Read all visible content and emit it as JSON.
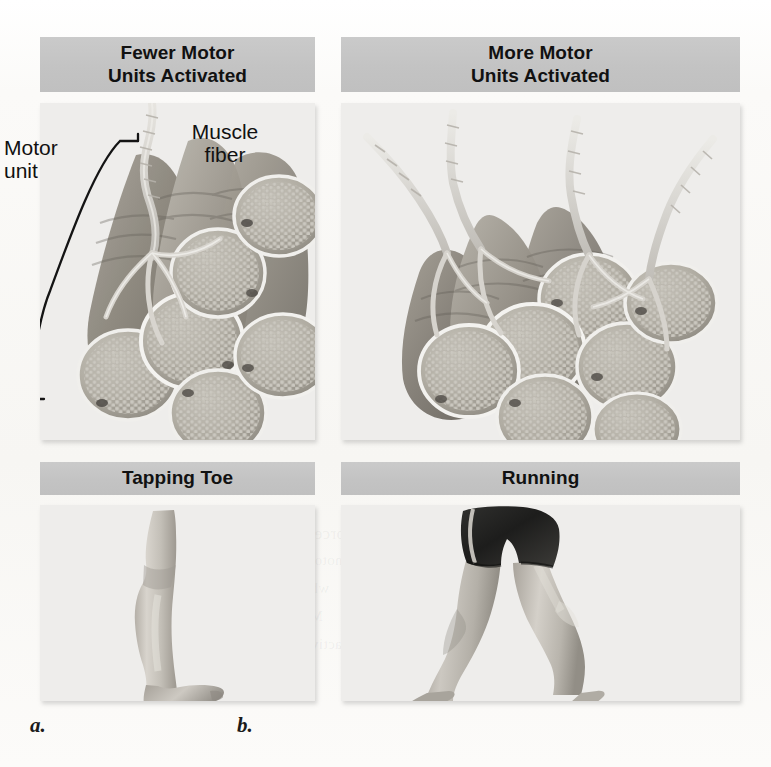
{
  "figure": {
    "background_color": "#fbfaf8",
    "bar_color": "#c5c5c5",
    "panel_color": "#eeedeb"
  },
  "panels": {
    "a": {
      "caption": "a.",
      "header": {
        "line1": "Fewer Motor",
        "line2": "Units Activated"
      },
      "sublabel": "Tapping Toe",
      "annotations": {
        "motor_unit": "Motor\nunit",
        "muscle_fiber": "Muscle\nfiber"
      },
      "illustration": "motor-unit-few-fibers",
      "photo": "tapping-toe-leg"
    },
    "b": {
      "caption": "b.",
      "header": {
        "line1": "More Motor",
        "line2": "Units Activated"
      },
      "sublabel": "Running",
      "annotations": {},
      "illustration": "motor-unit-many-fibers",
      "photo": "running-legs"
    }
  },
  "bleed_through_text": [
    "Figure 10.9 Recruitment",
    "of motor units varies with",
    "the force needed. a. Fewer",
    "motor units are activated",
    "when tapping a toe. b.",
    "More motor units are",
    "activated when running."
  ]
}
